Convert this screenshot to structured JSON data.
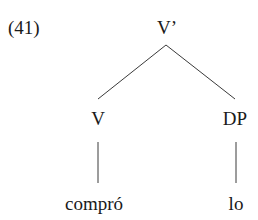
{
  "example": {
    "number": "(41)"
  },
  "tree": {
    "root": {
      "label": "V’"
    },
    "children": [
      {
        "label": "V",
        "leaf": "compró"
      },
      {
        "label": "DP",
        "leaf": "lo"
      }
    ]
  },
  "colors": {
    "text": "#1a1a1a",
    "edges": "#3a3a3a",
    "background": "#ffffff"
  }
}
